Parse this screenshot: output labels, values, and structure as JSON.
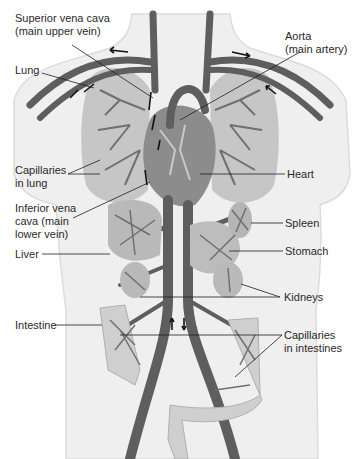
{
  "diagram": {
    "type": "anatomical-illustration",
    "colors": {
      "body": "#efefef",
      "body_outline": "#dcdcdc",
      "vessel": "#5e5e5e",
      "organ_fill": "#b9b9b9",
      "capillary": "#6f6f6f",
      "intestine": "#cfcfcf",
      "leader_line": "#1e1e1e",
      "text": "#2a2a2a"
    },
    "labels": {
      "superior_vena_cava": "Superior vena cava\n(main upper vein)",
      "aorta": "Aorta\n(main artery)",
      "lung": "Lung",
      "capillaries_lung": "Capillaries\nin lung",
      "heart": "Heart",
      "inferior_vena_cava": "Inferior vena\ncava (main\nlower vein)",
      "spleen": "Spleen",
      "liver": "Liver",
      "stomach": "Stomach",
      "kidneys": "Kidneys",
      "intestine": "Intestine",
      "capillaries_intestines": "Capillaries\nin intestines"
    }
  }
}
